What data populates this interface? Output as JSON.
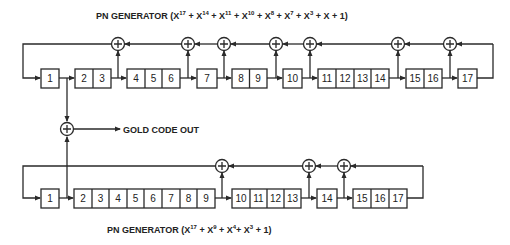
{
  "diagram": {
    "top_generator": {
      "title": "PN GENERATOR (X¹⁷ + X¹⁴ + X¹¹ + X¹⁰ + X⁸ + X⁷ + X³ + X + 1)",
      "title_parts": [
        "PN GENERATOR (X",
        "17",
        " + X",
        "14",
        " + X",
        "11",
        " + X",
        "10",
        " + X",
        "8",
        " + X",
        "7",
        " + X",
        "3",
        " + X + 1)"
      ],
      "stages": [
        "1",
        "2",
        "3",
        "4",
        "5",
        "6",
        "7",
        "8",
        "9",
        "10",
        "11",
        "12",
        "13",
        "14",
        "15",
        "16",
        "17"
      ],
      "box_groups": [
        [
          "1"
        ],
        [
          "2",
          "3"
        ],
        [
          "4",
          "5",
          "6"
        ],
        [
          "7"
        ],
        [
          "8",
          "9"
        ],
        [
          "10"
        ],
        [
          "11",
          "12",
          "13",
          "14"
        ],
        [
          "15",
          "16"
        ],
        [
          "17"
        ]
      ],
      "xor_taps_after_stage": [
        3,
        6,
        7,
        9,
        10,
        14,
        16
      ]
    },
    "bottom_generator": {
      "title": "PN GENERATOR (X¹⁷ + X⁹ + X⁴ + X³ + 1)",
      "title_parts": [
        "PN GENERATOR (X",
        "17",
        " + X",
        "9",
        " + X",
        "4",
        "+ X",
        "3",
        " + 1)"
      ],
      "stages": [
        "1",
        "2",
        "3",
        "4",
        "5",
        "6",
        "7",
        "8",
        "9",
        "10",
        "11",
        "12",
        "13",
        "14",
        "15",
        "16",
        "17"
      ],
      "box_groups": [
        [
          "1"
        ],
        [
          "2",
          "3",
          "4",
          "5",
          "6",
          "7",
          "8",
          "9"
        ],
        [
          "10",
          "11",
          "12",
          "13"
        ],
        [
          "14"
        ],
        [
          "15",
          "16",
          "17"
        ]
      ],
      "xor_taps_after_stage": [
        9,
        13,
        14
      ]
    },
    "output": {
      "label": "GOLD CODE OUT",
      "combiner_symbol": "+"
    }
  }
}
